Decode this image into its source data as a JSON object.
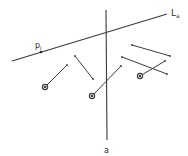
{
  "diagram": {
    "title": "",
    "stroke_color": "#3a3a3a",
    "lines": {
      "La": {
        "x1": 12,
        "y1": 61,
        "x2": 167,
        "y2": 14,
        "label": "L",
        "subscript": "a",
        "label_x": 171,
        "label_y": 16
      },
      "a": {
        "x1": 106,
        "y1": 10,
        "x2": 107,
        "y2": 140,
        "label": "a",
        "label_x": 104,
        "label_y": 153
      }
    },
    "point": {
      "x": 41,
      "y": 52,
      "label": "p",
      "subscript": "i",
      "label_x": 35,
      "label_y": 48
    },
    "segments": [
      {
        "x1": 67,
        "y1": 65,
        "x2": 45,
        "y2": 87,
        "end_marker": "circle"
      },
      {
        "x1": 75,
        "y1": 56,
        "x2": 93,
        "y2": 79,
        "end_marker": "none"
      },
      {
        "x1": 121,
        "y1": 66,
        "x2": 92,
        "y2": 96,
        "end_marker": "circle"
      },
      {
        "x1": 132,
        "y1": 45,
        "x2": 170,
        "y2": 56,
        "end_marker": "none"
      },
      {
        "x1": 122,
        "y1": 57,
        "x2": 167,
        "y2": 74,
        "end_marker": "none"
      },
      {
        "x1": 165,
        "y1": 61,
        "x2": 140,
        "y2": 76,
        "end_marker": "circle"
      }
    ]
  }
}
